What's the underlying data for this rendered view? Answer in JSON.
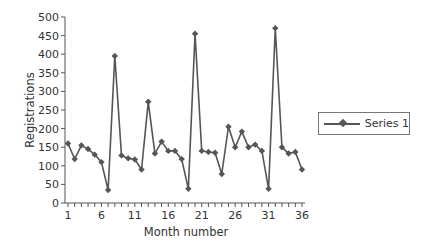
{
  "chart_data": {
    "type": "line",
    "title": "",
    "xlabel": "Month number",
    "ylabel": "Registrations",
    "ylim": [
      0,
      500
    ],
    "xlim": [
      1,
      36
    ],
    "y_ticks": [
      0,
      50,
      100,
      150,
      200,
      250,
      300,
      350,
      400,
      450,
      500
    ],
    "x_tick_labels": [
      "1",
      "6",
      "11",
      "16",
      "21",
      "26",
      "31",
      "36"
    ],
    "grid": false,
    "legend_position": "right",
    "x": [
      1,
      2,
      3,
      4,
      5,
      6,
      7,
      8,
      9,
      10,
      11,
      12,
      13,
      14,
      15,
      16,
      17,
      18,
      19,
      20,
      21,
      22,
      23,
      24,
      25,
      26,
      27,
      28,
      29,
      30,
      31,
      32,
      33,
      34,
      35,
      36
    ],
    "series": [
      {
        "name": "Series 1",
        "marker": "diamond",
        "color": "#555555",
        "values": [
          160,
          118,
          155,
          145,
          130,
          110,
          35,
          395,
          128,
          120,
          117,
          90,
          272,
          133,
          165,
          140,
          140,
          118,
          38,
          455,
          140,
          137,
          135,
          78,
          205,
          150,
          192,
          150,
          157,
          140,
          38,
          470,
          150,
          133,
          137,
          90
        ]
      }
    ]
  },
  "axes": {
    "x_title": "Month number",
    "y_title": "Registrations"
  },
  "legend": {
    "label": "Series 1"
  }
}
